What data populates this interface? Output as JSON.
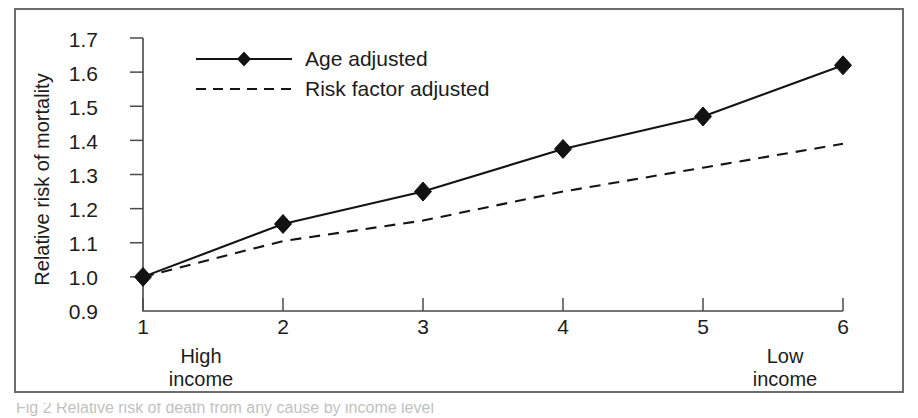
{
  "figure": {
    "caption_partial": "Fig 2 Relative risk of death from any cause by income level"
  },
  "axes": {
    "y_title": "Relative risk of mortality",
    "y_ticks": [
      "0.9",
      "1.0",
      "1.1",
      "1.2",
      "1.3",
      "1.4",
      "1.5",
      "1.6",
      "1.7"
    ],
    "x_ticks": [
      "1",
      "2",
      "3",
      "4",
      "5",
      "6"
    ],
    "x_left_annotation_line1": "High",
    "x_left_annotation_line2": "income",
    "x_right_annotation_line1": "Low",
    "x_right_annotation_line2": "income"
  },
  "legend": {
    "entries": [
      {
        "label": "Age adjusted",
        "style": "solid-with-diamond"
      },
      {
        "label": "Risk factor adjusted",
        "style": "dashed"
      }
    ]
  },
  "colors": {
    "line": "#141414",
    "axis": "#4a4a4a",
    "frame": "#6d6d6d",
    "background": "#ffffff"
  },
  "chart_data": {
    "type": "line",
    "title": "",
    "xlabel": "",
    "ylabel": "Relative risk of mortality",
    "x": [
      1,
      2,
      3,
      4,
      5,
      6
    ],
    "xtick_labels": [
      "1",
      "2",
      "3",
      "4",
      "5",
      "6"
    ],
    "xlim": [
      1,
      6
    ],
    "ylim": [
      0.9,
      1.7
    ],
    "ytick_labels": [
      "0.9",
      "1.0",
      "1.1",
      "1.2",
      "1.3",
      "1.4",
      "1.5",
      "1.6",
      "1.7"
    ],
    "grid": false,
    "legend_position": "upper-left-inside",
    "annotations": [
      {
        "text": "High income",
        "position": "below-x-axis-left"
      },
      {
        "text": "Low income",
        "position": "below-x-axis-right"
      }
    ],
    "series": [
      {
        "name": "Age adjusted",
        "style": "solid",
        "marker": "diamond",
        "values": [
          1.0,
          1.155,
          1.25,
          1.375,
          1.47,
          1.62
        ]
      },
      {
        "name": "Risk factor adjusted",
        "style": "dashed",
        "marker": "none",
        "values": [
          1.0,
          1.105,
          1.165,
          1.25,
          1.32,
          1.39
        ]
      }
    ]
  }
}
